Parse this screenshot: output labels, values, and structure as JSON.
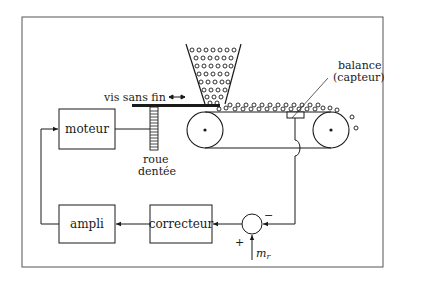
{
  "diagram": {
    "type": "block-diagram",
    "blocks": {
      "moteur": "moteur",
      "ampli": "ampli",
      "correcteur": "correcteur"
    },
    "labels": {
      "vis_sans_fin": "vis sans fin",
      "roue_line1": "roue",
      "roue_line2": "dentée",
      "balance_line1": "balance",
      "balance_line2": "(capteur)",
      "reference": "m",
      "reference_sub": "r",
      "sum_plus": "+",
      "sum_minus": "−"
    },
    "connections": [
      {
        "from": "balance",
        "to": "sommateur",
        "sign": "−"
      },
      {
        "from": "m_r",
        "to": "sommateur",
        "sign": "+"
      },
      {
        "from": "sommateur",
        "to": "correcteur"
      },
      {
        "from": "correcteur",
        "to": "ampli"
      },
      {
        "from": "ampli",
        "to": "moteur"
      },
      {
        "from": "moteur",
        "to": "roue dentée"
      }
    ],
    "colors": {
      "stroke": "#1a1a1a",
      "background": "#ffffff"
    }
  }
}
